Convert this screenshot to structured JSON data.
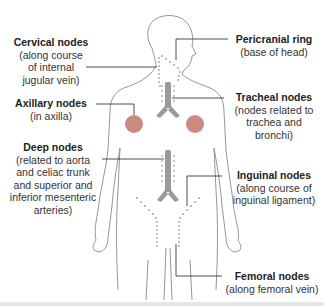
{
  "diagram": {
    "colors": {
      "body_outline": "#8a8a8a",
      "node_fill": "#c98a80",
      "node_dots": "#b0b0b0",
      "trachea": "#9a9a9a",
      "leader_line": "#222222"
    },
    "labels": [
      {
        "id": "cervical",
        "title": "Cervical nodes",
        "desc": "(along course\nof internal\njugular vein)"
      },
      {
        "id": "axillary",
        "title": "Axillary nodes",
        "desc": "(in axilla)"
      },
      {
        "id": "deep",
        "title": "Deep nodes",
        "desc": "(related to aorta\nand celiac trunk\nand superior and\ninferior mesenteric\narteries)"
      },
      {
        "id": "pericranial",
        "title": "Pericranial ring",
        "desc": "(base of head)"
      },
      {
        "id": "tracheal",
        "title": "Tracheal nodes",
        "desc": "(nodes related to\ntrachea and\nbronchi)"
      },
      {
        "id": "inguinal",
        "title": "Inguinal nodes",
        "desc": "(along course of\ninguinal ligament)"
      },
      {
        "id": "femoral",
        "title": "Femoral nodes",
        "desc": "(along femoral vein)"
      }
    ]
  }
}
